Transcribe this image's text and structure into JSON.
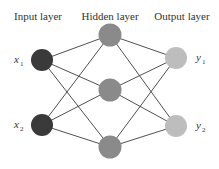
{
  "diagram": {
    "type": "neural-network",
    "layers": [
      {
        "title": "Input layer",
        "color": "#3a3a3a",
        "nodes": [
          {
            "label": "x",
            "sub": "1"
          },
          {
            "label": "x",
            "sub": "2"
          }
        ]
      },
      {
        "title": "Hidden layer",
        "color": "#8a8a8a",
        "nodes": [
          {
            "label": ""
          },
          {
            "label": ""
          },
          {
            "label": ""
          }
        ]
      },
      {
        "title": "Output layer",
        "color": "#bdbdbd",
        "nodes": [
          {
            "label": "y",
            "sub": "1"
          },
          {
            "label": "y",
            "sub": "2"
          }
        ]
      }
    ],
    "connections": "fully-connected",
    "edge_color": "#3c3c3c"
  }
}
